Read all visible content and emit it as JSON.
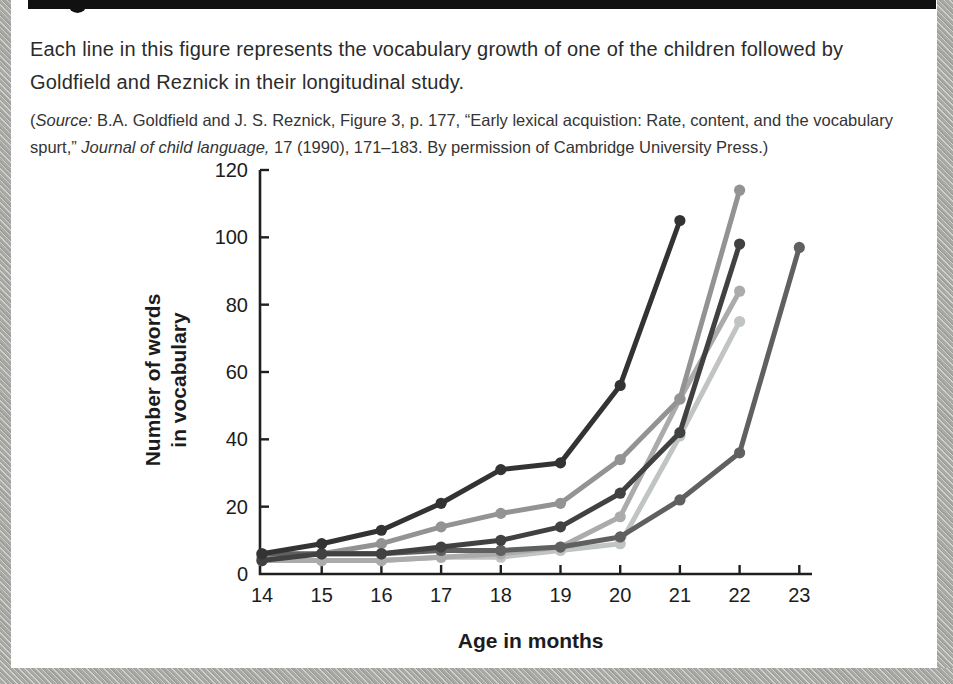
{
  "caption": "Each line in this figure represents the vocabulary growth of one of the children followed by Goldfield and Reznick in their longitudinal study.",
  "source": {
    "segments": [
      {
        "text": "(",
        "italic": false
      },
      {
        "text": "Source:",
        "italic": true
      },
      {
        "text": " B.A. Goldfield and J. S. Reznick, Figure 3, p. 177, “Early lexical acquistion: Rate, content, and the vocabulary spurt,” ",
        "italic": false
      },
      {
        "text": "Journal of child language,",
        "italic": true
      },
      {
        "text": " 17 (1990), 171–183. By permission of Cambridge University Press.)",
        "italic": false
      }
    ]
  },
  "chart_data": {
    "type": "line",
    "title": "",
    "xlabel": "Age in months",
    "ylabel": "Number of words in vocabulary",
    "ylabel_lines": [
      "Number of words",
      "in vocabulary"
    ],
    "x": [
      14,
      15,
      16,
      17,
      18,
      19,
      20,
      21,
      22,
      23
    ],
    "xlim": [
      14,
      23
    ],
    "ylim": [
      0,
      120
    ],
    "yticks": [
      0,
      20,
      40,
      60,
      80,
      100,
      120
    ],
    "grid": false,
    "legend": "none",
    "axis_color": "#1f1f1f",
    "series": [
      {
        "name": "child-6",
        "color": "#c0c4c4",
        "values": [
          4,
          4,
          4,
          5,
          5,
          7,
          9,
          41,
          75,
          null
        ]
      },
      {
        "name": "child-5",
        "color": "#ababab",
        "values": [
          4,
          4,
          4,
          5,
          6,
          8,
          17,
          52,
          84,
          null
        ]
      },
      {
        "name": "child-2",
        "color": "#939393",
        "values": [
          5,
          6,
          9,
          14,
          18,
          21,
          34,
          52,
          114,
          null
        ]
      },
      {
        "name": "child-4",
        "color": "#606060",
        "values": [
          6,
          6,
          6,
          7,
          7,
          8,
          11,
          22,
          36,
          97
        ]
      },
      {
        "name": "child-3",
        "color": "#414141",
        "values": [
          4,
          6,
          6,
          8,
          10,
          14,
          24,
          42,
          98,
          null
        ]
      },
      {
        "name": "child-1",
        "color": "#333333",
        "values": [
          6,
          9,
          13,
          21,
          31,
          33,
          56,
          105,
          null,
          null
        ]
      }
    ]
  }
}
